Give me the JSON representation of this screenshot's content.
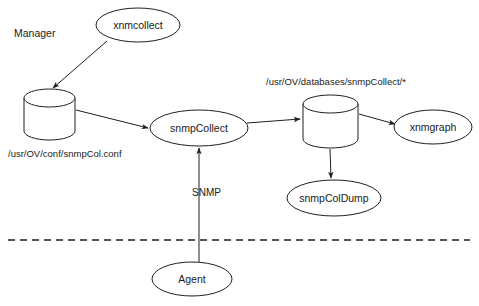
{
  "diagram": {
    "type": "flow-diagram",
    "background_color": "#ffffff",
    "stroke_color": "#1f1f1f",
    "canvas": {
      "width": 479,
      "height": 306
    },
    "zones": [
      {
        "id": "manager",
        "label": "Manager",
        "x": 14,
        "y": 33
      }
    ],
    "boundary": {
      "id": "manager-agent-boundary",
      "style": "dashed",
      "x1": 8,
      "y1": 240,
      "x2": 470,
      "y2": 240
    },
    "nodes": [
      {
        "id": "xnmcollect",
        "label": "xnmcollect",
        "shape": "ellipse",
        "cx": 138,
        "cy": 25,
        "rx": 42,
        "ry": 17
      },
      {
        "id": "snmpcol-conf-db",
        "label": "",
        "shape": "cylinder",
        "x": 24,
        "y": 89,
        "width": 51,
        "height": 51,
        "ellipse_ry": 9
      },
      {
        "id": "snmpcollect",
        "label": "snmpCollect",
        "shape": "ellipse",
        "cx": 199,
        "cy": 128,
        "rx": 49,
        "ry": 18
      },
      {
        "id": "snmpcollect-db",
        "label": "",
        "shape": "cylinder",
        "x": 303,
        "y": 95,
        "width": 55,
        "height": 53,
        "ellipse_ry": 9
      },
      {
        "id": "xnmgraph",
        "label": "xnmgraph",
        "shape": "ellipse",
        "cx": 433,
        "cy": 127,
        "rx": 39,
        "ry": 17
      },
      {
        "id": "snmpcoldump",
        "label": "snmpColDump",
        "shape": "ellipse",
        "cx": 334,
        "cy": 198,
        "rx": 47,
        "ry": 18
      },
      {
        "id": "agent",
        "label": "Agent",
        "shape": "ellipse",
        "cx": 192,
        "cy": 279,
        "rx": 40,
        "ry": 17
      }
    ],
    "captions": [
      {
        "id": "snmpcol-conf-path",
        "text": "/usr/OV/conf/snmpCol.conf",
        "x": 8,
        "y": 157,
        "anchor": "start",
        "for_node": "snmpcol-conf-db"
      },
      {
        "id": "snmpcollect-db-path",
        "text": "/usr/OV/databases/snmpCollect/*",
        "x": 266,
        "y": 85,
        "anchor": "start",
        "for_node": "snmpcollect-db"
      }
    ],
    "edges": [
      {
        "id": "xnmcollect-to-conf-db",
        "from": "xnmcollect",
        "to": "snmpcol-conf-db",
        "label": "",
        "arrowhead": true,
        "path": "M 107 41 L 53 88"
      },
      {
        "id": "conf-db-to-snmpcollect",
        "from": "snmpcol-conf-db",
        "to": "snmpcollect",
        "label": "",
        "arrowhead": true,
        "path": "M 76 110 L 148 128"
      },
      {
        "id": "agent-to-snmpcollect",
        "from": "agent",
        "to": "snmpcollect",
        "label": "SNMP",
        "label_x": 192,
        "label_y": 196,
        "arrowhead": true,
        "path": "M 199 262 L 199 148"
      },
      {
        "id": "snmpcollect-to-db",
        "from": "snmpcollect",
        "to": "snmpcollect-db",
        "label": "",
        "arrowhead": true,
        "path": "M 247 123 L 300 119"
      },
      {
        "id": "db-to-xnmgraph",
        "from": "snmpcollect-db",
        "to": "xnmgraph",
        "label": "",
        "arrowhead": true,
        "path": "M 359 114 L 395 124"
      },
      {
        "id": "db-to-snmpcoldump",
        "from": "snmpcollect-db",
        "to": "snmpcoldump",
        "label": "",
        "arrowhead": true,
        "path": "M 330 149 L 331 178"
      }
    ]
  }
}
